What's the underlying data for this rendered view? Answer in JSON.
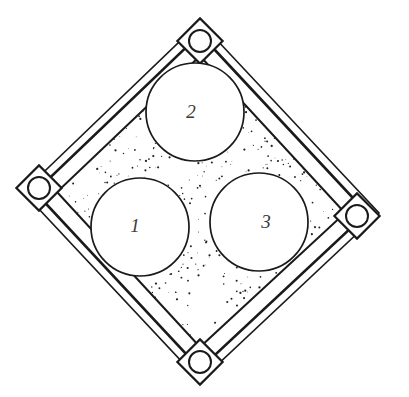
{
  "figure": {
    "type": "engineering-plan-drawing",
    "background_color": "#ffffff",
    "line_color": "#1a1a1a",
    "stipple_color": "#222222",
    "cavity_fill_color": "#ffffff",
    "label_color": "#3a3a3a",
    "canvas": {
      "width": 409,
      "height": 397
    }
  },
  "frame": {
    "name": "square-frame-rotated-45",
    "outer_vertices": [
      {
        "name": "top",
        "x": 200,
        "y": 22
      },
      {
        "name": "right",
        "x": 379,
        "y": 213
      },
      {
        "name": "bottom",
        "x": 200,
        "y": 381
      },
      {
        "name": "left",
        "x": 23,
        "y": 192
      }
    ],
    "mid_vertices": [
      {
        "name": "top",
        "x": 200,
        "y": 34
      },
      {
        "name": "right",
        "x": 367,
        "y": 213
      },
      {
        "name": "bottom",
        "x": 200,
        "y": 369
      },
      {
        "name": "left",
        "x": 35,
        "y": 192
      }
    ],
    "inner_vertices": [
      {
        "name": "top",
        "x": 200,
        "y": 56
      },
      {
        "name": "right",
        "x": 345,
        "y": 213
      },
      {
        "name": "bottom",
        "x": 200,
        "y": 347
      },
      {
        "name": "left",
        "x": 57,
        "y": 192
      }
    ],
    "outer_line_width": 1.6,
    "inner_band_line_width": 3.0
  },
  "corner_bolts": [
    {
      "label": "top-bolt",
      "cx": 200,
      "cy": 41,
      "r": 11,
      "bracket_size": 16
    },
    {
      "label": "left-bolt",
      "cx": 39,
      "cy": 188,
      "r": 11,
      "bracket_size": 16
    },
    {
      "label": "right-bolt",
      "cx": 357,
      "cy": 216,
      "r": 11,
      "bracket_size": 16
    },
    {
      "label": "bottom-bolt",
      "cx": 200,
      "cy": 362,
      "r": 11,
      "bracket_size": 16
    }
  ],
  "cavities": [
    {
      "id": 1,
      "label": "1",
      "cx": 140,
      "cy": 227,
      "r": 49,
      "label_x": 135,
      "label_y": 232
    },
    {
      "id": 2,
      "label": "2",
      "cx": 195,
      "cy": 112,
      "r": 49,
      "label_x": 191,
      "label_y": 118
    },
    {
      "id": 3,
      "label": "3",
      "cx": 259,
      "cy": 222,
      "r": 49,
      "label_x": 266,
      "label_y": 228
    }
  ],
  "stipple": {
    "description": "hand-drawn granular concrete hatch fill between frame and cavities",
    "dot_count": 2600,
    "dot_min_radius": 0.35,
    "dot_max_radius": 1.15,
    "seed": 20240617
  }
}
